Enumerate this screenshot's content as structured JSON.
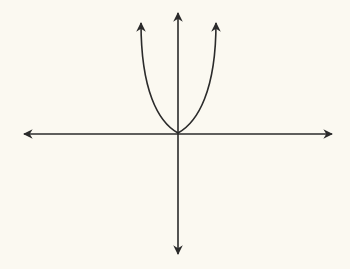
{
  "diagram": {
    "title": "",
    "background_color": "#fbf9f1",
    "stroke_color": "#2b2b2b",
    "axes": {
      "x_axis": {
        "arrows": [
          "left",
          "right"
        ],
        "labels": []
      },
      "y_axis": {
        "arrows": [
          "up",
          "down"
        ],
        "labels": []
      }
    },
    "curve": {
      "shape": "U-shaped, vertex at origin",
      "arrows": [
        "upper-left",
        "upper-right"
      ]
    }
  }
}
